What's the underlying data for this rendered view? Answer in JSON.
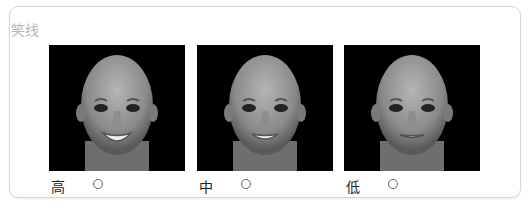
{
  "section": {
    "title": "笑线"
  },
  "options": [
    {
      "label": "高",
      "selected": false,
      "image": "face-smile-high"
    },
    {
      "label": "中",
      "selected": false,
      "image": "face-smile-medium"
    },
    {
      "label": "低",
      "selected": false,
      "image": "face-smile-low"
    }
  ],
  "colors": {
    "title": "#b8b8b8",
    "border": "#d6d6d6",
    "image_bg": "#000000"
  }
}
